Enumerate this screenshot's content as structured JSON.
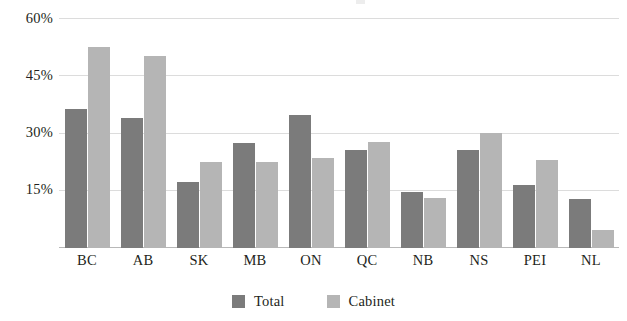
{
  "chart_data": {
    "type": "bar",
    "title": "",
    "xlabel": "",
    "ylabel": "",
    "categories": [
      "BC",
      "AB",
      "SK",
      "MB",
      "ON",
      "QC",
      "NB",
      "NS",
      "PEI",
      "NL"
    ],
    "series": [
      {
        "name": "Total",
        "color": "#7b7b7b",
        "values": [
          36.3,
          33.9,
          17.2,
          27.4,
          34.7,
          25.6,
          14.6,
          25.6,
          16.4,
          12.8
        ]
      },
      {
        "name": "Cabinet",
        "color": "#b5b5b5",
        "values": [
          52.4,
          50.1,
          22.4,
          22.4,
          23.5,
          27.7,
          13.0,
          30.0,
          23.0,
          4.7
        ]
      }
    ],
    "ylim": [
      0,
      60
    ],
    "yticks": [
      15,
      30,
      45,
      60
    ],
    "ytick_labels": [
      "15%",
      "30%",
      "45%",
      "60%"
    ],
    "grid": true,
    "legend_position": "bottom"
  },
  "legend": {
    "items": [
      {
        "label": "Total",
        "color": "#7b7b7b"
      },
      {
        "label": "Cabinet",
        "color": "#b5b5b5"
      }
    ]
  }
}
